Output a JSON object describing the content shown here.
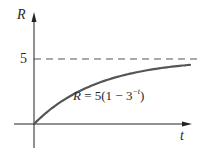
{
  "chart_data": {
    "type": "line",
    "title": "",
    "xlabel": "t",
    "ylabel": "R",
    "yticks": [
      "5"
    ],
    "xticks": [],
    "grid": false,
    "legend": null,
    "asymptote": {
      "y": 5,
      "style": "dashed",
      "label": "5"
    },
    "annotations": [
      {
        "text": "R = 5(1 − 3^(−t))",
        "position": "below curve, center"
      }
    ],
    "series": [
      {
        "name": "R = 5(1 − 3^(−t))",
        "function": "5*(1-3^(-t))",
        "x": [
          0,
          0.5,
          1,
          1.5,
          2,
          2.5,
          3,
          3.5,
          4,
          4.5,
          5
        ],
        "values": [
          0,
          2.11,
          3.33,
          4.04,
          4.44,
          4.68,
          4.81,
          4.89,
          4.94,
          4.96,
          4.98
        ]
      }
    ],
    "xlim": [
      0,
      5
    ],
    "ylim": [
      0,
      5
    ]
  },
  "labels": {
    "y_axis": "R",
    "x_axis": "t",
    "y_tick_5": "5",
    "equation_prefix": "R",
    "equation_body": " = 5(1 − 3",
    "equation_exp": "−t",
    "equation_suffix": ")"
  },
  "colors": {
    "axis": "#222222",
    "curve": "#555555",
    "dashed": "#555555",
    "text": "#2a2a2a"
  }
}
